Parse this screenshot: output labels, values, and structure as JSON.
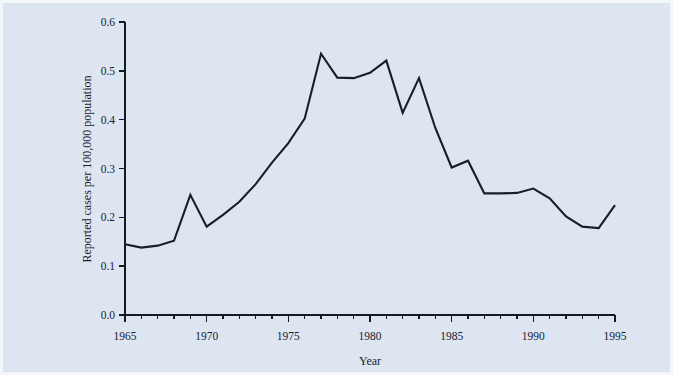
{
  "figure": {
    "background_color": "#dde6f0",
    "line_color": "#171d2b",
    "axis_color": "#141a24"
  },
  "chart_data": {
    "type": "line",
    "title": "",
    "xlabel": "Year",
    "ylabel": "Reported cases per 100,000 population",
    "xlim": [
      1965,
      1995
    ],
    "ylim": [
      0.0,
      0.6
    ],
    "grid": false,
    "legend": null,
    "x_tick_labels": [
      "1965",
      "1970",
      "1975",
      "1980",
      "1985",
      "1990",
      "1995"
    ],
    "x_tick_values": [
      1965,
      1970,
      1975,
      1980,
      1985,
      1990,
      1995
    ],
    "x_minor_tick_interval": 1,
    "y_tick_labels": [
      "0.0",
      "0.1",
      "0.2",
      "0.3",
      "0.4",
      "0.5",
      "0.6"
    ],
    "y_tick_values": [
      0.0,
      0.1,
      0.2,
      0.3,
      0.4,
      0.5,
      0.6
    ],
    "x": [
      1965,
      1966,
      1967,
      1968,
      1969,
      1970,
      1971,
      1972,
      1973,
      1974,
      1975,
      1976,
      1977,
      1978,
      1979,
      1980,
      1981,
      1982,
      1983,
      1984,
      1985,
      1986,
      1987,
      1988,
      1989,
      1990,
      1991,
      1992,
      1993,
      1994,
      1995
    ],
    "values": [
      0.145,
      0.138,
      0.142,
      0.152,
      0.246,
      0.181,
      0.205,
      0.232,
      0.268,
      0.312,
      0.352,
      0.402,
      0.535,
      0.486,
      0.485,
      0.496,
      0.521,
      0.414,
      0.485,
      0.383,
      0.302,
      0.316,
      0.249,
      0.249,
      0.25,
      0.259,
      0.239,
      0.202,
      0.181,
      0.178,
      0.225
    ],
    "series": [
      {
        "name": "Reported cases per 100,000 population",
        "values": [
          0.145,
          0.138,
          0.142,
          0.152,
          0.246,
          0.181,
          0.205,
          0.232,
          0.268,
          0.312,
          0.352,
          0.402,
          0.535,
          0.486,
          0.485,
          0.496,
          0.521,
          0.414,
          0.485,
          0.383,
          0.302,
          0.316,
          0.249,
          0.249,
          0.25,
          0.259,
          0.239,
          0.202,
          0.181,
          0.178,
          0.225
        ]
      }
    ]
  }
}
